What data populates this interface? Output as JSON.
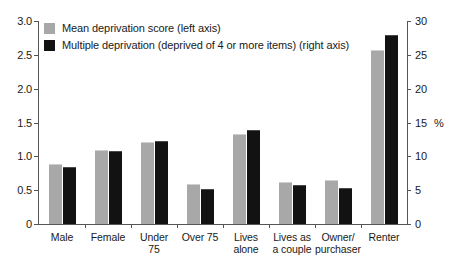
{
  "chart_data": {
    "type": "bar",
    "title": "",
    "xlabel": "",
    "ylabel": "",
    "grid": false,
    "legend_position": "top-left",
    "categories": [
      "Male",
      "Female",
      "Under 75",
      "Over 75",
      "Lives alone",
      "Lives as a couple",
      "Owner/ purchaser",
      "Renter"
    ],
    "category_lines": [
      [
        "Male"
      ],
      [
        "Female"
      ],
      [
        "Under",
        "75"
      ],
      [
        "Over 75"
      ],
      [
        "Lives",
        "alone"
      ],
      [
        "Lives as",
        "a couple"
      ],
      [
        "Owner/",
        "purchaser"
      ],
      [
        "Renter"
      ]
    ],
    "series": [
      {
        "name": "Mean deprivation score (left axis)",
        "axis": "left",
        "color": "#a8a8a8",
        "values": [
          0.89,
          1.1,
          1.21,
          0.59,
          1.33,
          0.62,
          0.65,
          2.57
        ]
      },
      {
        "name": "Multiple deprivation (deprived of 4 or more items) (right axis)",
        "axis": "right",
        "color": "#121212",
        "values": [
          8.4,
          10.8,
          12.3,
          5.2,
          13.9,
          5.8,
          5.3,
          28.0
        ]
      }
    ],
    "left_axis": {
      "label": "",
      "ylim": [
        0,
        3.0
      ],
      "ticks": [
        "0",
        "0.5",
        "1.0",
        "1.5",
        "2.0",
        "2.5",
        "3.0"
      ],
      "tick_values": [
        0,
        0.5,
        1.0,
        1.5,
        2.0,
        2.5,
        3.0
      ]
    },
    "right_axis": {
      "label": "%",
      "ylim": [
        0,
        30
      ],
      "ticks": [
        "0",
        "5",
        "10",
        "15",
        "20",
        "25",
        "30"
      ],
      "tick_values": [
        0,
        5,
        10,
        15,
        20,
        25,
        30
      ]
    }
  },
  "legend": {
    "items": [
      {
        "label": "Mean deprivation score (left axis)",
        "color": "#a8a8a8"
      },
      {
        "label": "Multiple deprivation (deprived of 4 or more items) (right axis)",
        "color": "#121212"
      }
    ]
  }
}
